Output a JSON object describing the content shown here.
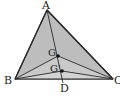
{
  "figure": {
    "type": "geometry-triangle",
    "fill_color": "#bdbdbd",
    "stroke_color": "#2a2a2a",
    "background": "#ffffff"
  },
  "points": {
    "A": {
      "label": "A",
      "x": 47,
      "y": 10
    },
    "B": {
      "label": "B",
      "x": 15,
      "y": 79
    },
    "C": {
      "label": "C",
      "x": 113,
      "y": 79
    },
    "D": {
      "label": "D",
      "x": 63,
      "y": 79
    },
    "G": {
      "label": "G",
      "x": 58,
      "y": 56
    },
    "G2": {
      "label": "G'",
      "x": 62,
      "y": 71
    }
  },
  "segments": [
    "AB",
    "BC",
    "CA",
    "AD",
    "BG",
    "CG",
    "BG'",
    "CG'"
  ]
}
